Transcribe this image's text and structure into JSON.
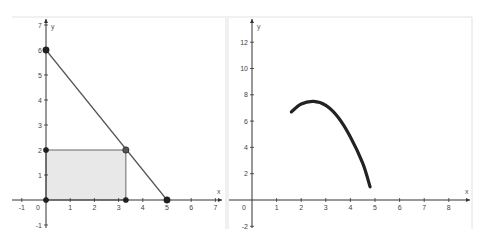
{
  "chart_data": [
    {
      "type": "line",
      "title": "",
      "xlabel": "x",
      "ylabel": "y",
      "xlim": [
        -1.4,
        7.3
      ],
      "ylim": [
        -1.2,
        7.2
      ],
      "grid": false,
      "x_ticks": [
        "-1",
        "0",
        "1",
        "2",
        "3",
        "4",
        "5",
        "6",
        "7"
      ],
      "y_ticks": [
        "-1",
        "1",
        "2",
        "3",
        "4",
        "5",
        "6",
        "7"
      ],
      "series": [
        {
          "name": "line",
          "points": [
            [
              0,
              6
            ],
            [
              5,
              0
            ]
          ]
        },
        {
          "name": "rectangle",
          "points": [
            [
              0,
              0
            ],
            [
              3.3,
              0
            ],
            [
              3.3,
              2
            ],
            [
              0,
              2
            ]
          ],
          "fill": "#e6e6e6"
        }
      ],
      "points": [
        {
          "x": 0,
          "y": 6
        },
        {
          "x": 5,
          "y": 0
        },
        {
          "x": 3.3,
          "y": 2
        },
        {
          "x": 0,
          "y": 2
        },
        {
          "x": 0,
          "y": 0
        },
        {
          "x": 3.3,
          "y": 0
        }
      ]
    },
    {
      "type": "line",
      "title": "",
      "xlabel": "x",
      "ylabel": "y",
      "xlim": [
        -0.5,
        8.8
      ],
      "ylim": [
        -2.2,
        13.5
      ],
      "grid": false,
      "x_ticks": [
        "0",
        "1",
        "2",
        "3",
        "4",
        "5",
        "6",
        "7",
        "8"
      ],
      "y_ticks": [
        "-2",
        "2",
        "4",
        "6",
        "8",
        "10",
        "12"
      ],
      "series": [
        {
          "name": "curve",
          "points": [
            [
              1.6,
              6.7
            ],
            [
              2.0,
              7.3
            ],
            [
              2.5,
              7.5
            ],
            [
              3.0,
              7.2
            ],
            [
              3.5,
              6.3
            ],
            [
              4.0,
              4.8
            ],
            [
              4.5,
              2.8
            ],
            [
              4.8,
              1.0
            ]
          ]
        }
      ]
    }
  ],
  "left": {
    "x_axis_label": "x",
    "y_axis_label": "y",
    "x_ticks": [
      {
        "v": -1,
        "label": "-1"
      },
      {
        "v": 1,
        "label": "1"
      },
      {
        "v": 2,
        "label": "2"
      },
      {
        "v": 3,
        "label": "3"
      },
      {
        "v": 4,
        "label": "4"
      },
      {
        "v": 5,
        "label": "5"
      },
      {
        "v": 6,
        "label": "6"
      },
      {
        "v": 7,
        "label": "7"
      }
    ],
    "origin_label": "0",
    "y_ticks": [
      {
        "v": -1,
        "label": "-1"
      },
      {
        "v": 1,
        "label": "1"
      },
      {
        "v": 2,
        "label": "2"
      },
      {
        "v": 3,
        "label": "3"
      },
      {
        "v": 4,
        "label": "4"
      },
      {
        "v": 5,
        "label": "5"
      },
      {
        "v": 6,
        "label": "6"
      },
      {
        "v": 7,
        "label": "7"
      }
    ]
  },
  "right": {
    "x_axis_label": "x",
    "y_axis_label": "y",
    "x_ticks": [
      {
        "v": 1,
        "label": "1"
      },
      {
        "v": 2,
        "label": "2"
      },
      {
        "v": 3,
        "label": "3"
      },
      {
        "v": 4,
        "label": "4"
      },
      {
        "v": 5,
        "label": "5"
      },
      {
        "v": 6,
        "label": "6"
      },
      {
        "v": 7,
        "label": "7"
      },
      {
        "v": 8,
        "label": "8"
      }
    ],
    "origin_label": "0",
    "y_ticks": [
      {
        "v": -2,
        "label": "-2"
      },
      {
        "v": 2,
        "label": "2"
      },
      {
        "v": 4,
        "label": "4"
      },
      {
        "v": 6,
        "label": "6"
      },
      {
        "v": 8,
        "label": "8"
      },
      {
        "v": 10,
        "label": "10"
      },
      {
        "v": 12,
        "label": "12"
      }
    ]
  },
  "colors": {
    "axis": "#333333",
    "line": "#555555",
    "curve": "#222222",
    "rect_fill": "#e8e8e8",
    "rect_stroke": "#666666",
    "point": "#222222",
    "point_highlight": "#555555",
    "panel_border": "#dddddd"
  }
}
